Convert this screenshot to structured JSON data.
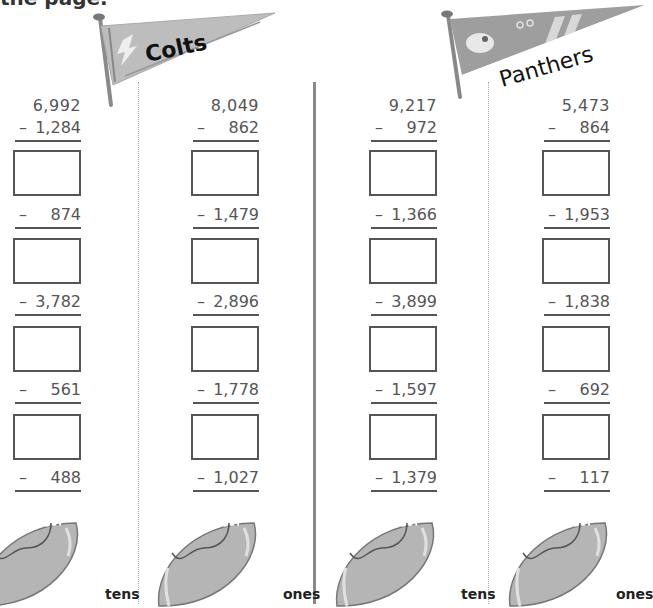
{
  "intro_text": "the page.",
  "teams": [
    {
      "name": "Colts",
      "color": "#bdbdbd"
    },
    {
      "name": "Panthers",
      "color": "#9e9e9e"
    }
  ],
  "columns": [
    {
      "start": "6,992",
      "subtrahends": [
        "1,284",
        "874",
        "3,782",
        "561",
        "488"
      ],
      "place_label": "tens"
    },
    {
      "start": "8,049",
      "subtrahends": [
        "862",
        "1,479",
        "2,896",
        "1,778",
        "1,027"
      ],
      "place_label": "ones"
    },
    {
      "start": "9,217",
      "subtrahends": [
        "972",
        "1,366",
        "3,899",
        "1,597",
        "1,379"
      ],
      "place_label": "tens"
    },
    {
      "start": "5,473",
      "subtrahends": [
        "864",
        "1,953",
        "1,838",
        "692",
        "117"
      ],
      "place_label": "ones"
    }
  ],
  "minus_sign": "–",
  "answer_boxes_per_column": 4
}
